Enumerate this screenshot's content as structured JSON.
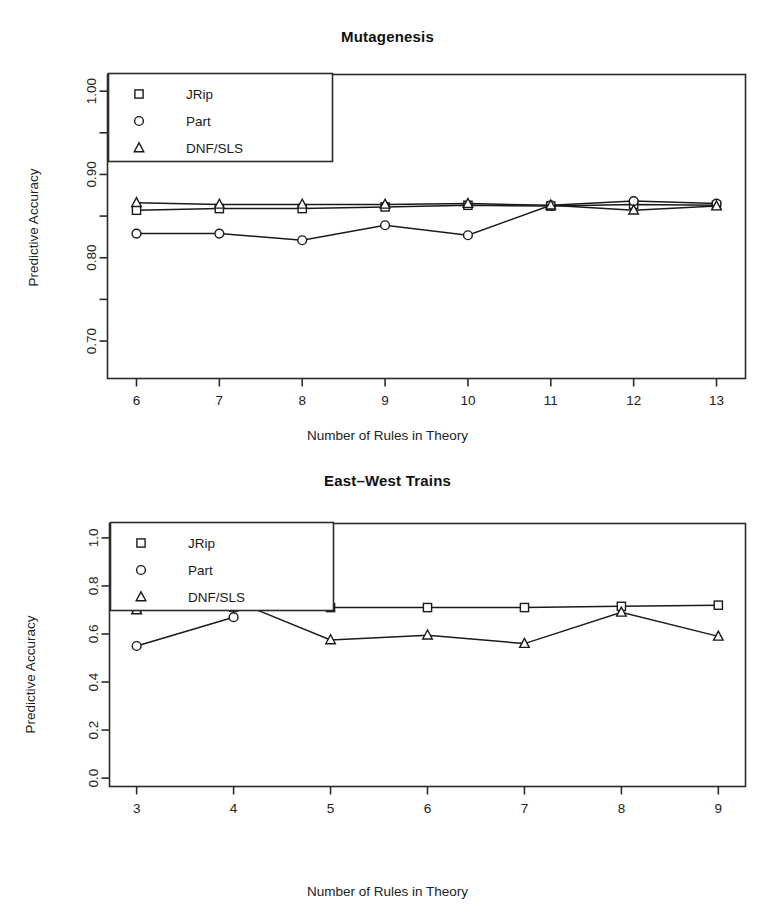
{
  "figure": {
    "width": 775,
    "height": 913,
    "background": "#ffffff",
    "ink_color": "#1a1a1a"
  },
  "shared": {
    "xlabel": "Number of Rules in Theory",
    "ylabel": "Predictive Accuracy",
    "legend_entries": [
      {
        "label": "JRip",
        "marker": "square"
      },
      {
        "label": "Part",
        "marker": "circle"
      },
      {
        "label": "DNF/SLS",
        "marker": "triangle"
      }
    ]
  },
  "chart_data": [
    {
      "type": "line",
      "title": "Mutagenesis",
      "xlabel": "Number of Rules in Theory",
      "ylabel": "Predictive Accuracy",
      "x": [
        6,
        7,
        8,
        9,
        10,
        11,
        12,
        13
      ],
      "xticklabels": [
        "6",
        "7",
        "8",
        "9",
        "10",
        "11",
        "12",
        "13"
      ],
      "xlim": [
        5.65,
        13.35
      ],
      "ylim": [
        0.655,
        1.02
      ],
      "yticks": [
        0.7,
        0.8,
        0.9,
        1.0
      ],
      "yticklabels": [
        "0.70",
        "0.80",
        "0.90",
        "1.00"
      ],
      "yminorticks": [
        0.75,
        0.85,
        0.95
      ],
      "grid": false,
      "legend_position": "top-left",
      "series": [
        {
          "name": "JRip",
          "marker": "square",
          "values": [
            0.857,
            0.859,
            0.859,
            0.861,
            0.863,
            0.862,
            0.864,
            0.863
          ]
        },
        {
          "name": "Part",
          "marker": "circle",
          "values": [
            0.829,
            0.829,
            0.821,
            0.839,
            0.827,
            0.863,
            0.868,
            0.865
          ]
        },
        {
          "name": "DNF/SLS",
          "marker": "triangle",
          "values": [
            0.866,
            0.864,
            0.864,
            0.864,
            0.865,
            0.863,
            0.857,
            0.862
          ]
        }
      ]
    },
    {
      "type": "line",
      "title": "East–West Trains",
      "xlabel": "Number of Rules in Theory",
      "ylabel": "Predictive Accuracy",
      "x": [
        3,
        4,
        5,
        6,
        7,
        8,
        9
      ],
      "xticklabels": [
        "3",
        "4",
        "5",
        "6",
        "7",
        "8",
        "9"
      ],
      "xlim": [
        2.72,
        9.28
      ],
      "ylim": [
        -0.035,
        1.06
      ],
      "yticks": [
        0.0,
        0.2,
        0.4,
        0.6,
        0.8,
        1.0
      ],
      "yticklabels": [
        "0.0",
        "0.2",
        "0.4",
        "0.6",
        "0.8",
        "1.0"
      ],
      "grid": false,
      "legend_position": "top-left",
      "series": [
        {
          "name": "JRip",
          "marker": "square",
          "values": [
            0.705,
            0.712,
            0.71,
            0.71,
            0.71,
            0.715,
            0.72
          ]
        },
        {
          "name": "Part",
          "marker": "circle",
          "values": [
            0.55,
            0.67,
            null,
            null,
            null,
            null,
            null
          ]
        },
        {
          "name": "DNF/SLS",
          "marker": "triangle",
          "values": [
            0.7,
            0.74,
            0.575,
            0.595,
            0.56,
            0.69,
            0.59
          ]
        }
      ]
    }
  ]
}
